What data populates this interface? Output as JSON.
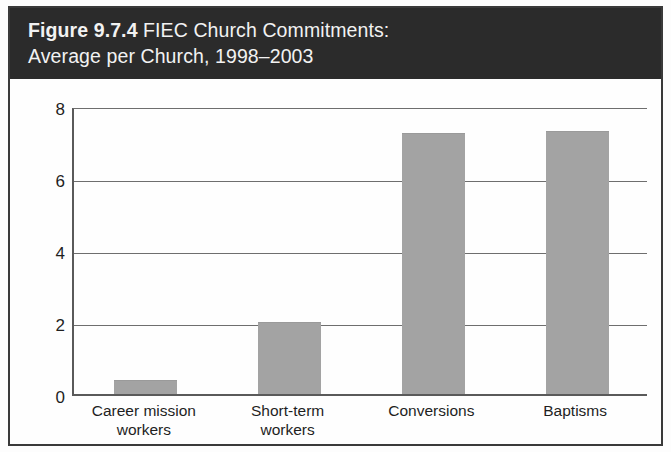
{
  "figure": {
    "number": "Figure 9.7.4",
    "title_rest": " FIEC Church Commitments:",
    "title_line2": "Average per Church, 1998–2003",
    "header_bg": "#2b2b2b",
    "header_text_color": "#f2f2f2",
    "bar_color": "#a3a3a3",
    "grid_color": "#6e6e6e",
    "frame_color": "#3a3a3a"
  },
  "chart_data": {
    "type": "bar",
    "title": "Figure 9.7.4 FIEC Church Commitments: Average per Church, 1998–2003",
    "xlabel": "",
    "ylabel": "",
    "categories": [
      "Career mission workers",
      "Short-term workers",
      "Conversions",
      "Baptisms"
    ],
    "category_lines": [
      [
        "Career mission",
        "workers"
      ],
      [
        "Short-term",
        "workers"
      ],
      [
        "Conversions"
      ],
      [
        "Baptisms"
      ]
    ],
    "values": [
      0.4,
      2.0,
      7.25,
      7.3
    ],
    "ylim": [
      0,
      8
    ],
    "yticks": [
      0,
      2,
      4,
      6,
      8
    ],
    "ytick_labels": [
      "0",
      "2",
      "4",
      "6",
      "8"
    ],
    "grid": true,
    "grid_axis": "y",
    "legend": false,
    "legend_position": "none",
    "bar_color": "#a3a3a3"
  }
}
